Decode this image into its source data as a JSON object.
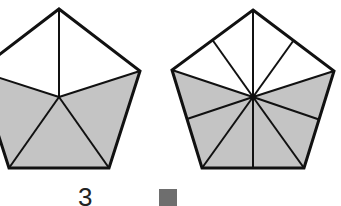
{
  "figure": {
    "shade_color": "#c4c4c4",
    "line_color": "#111111",
    "pentagons": [
      {
        "name": "pentagon-left",
        "parts": 5,
        "shaded_parts": 3,
        "center": [
          59,
          97
        ],
        "vertices": [
          [
            59,
            9
          ],
          [
            140,
            71
          ],
          [
            109,
            168
          ],
          [
            9,
            168
          ],
          [
            -22,
            71
          ]
        ]
      },
      {
        "name": "pentagon-right",
        "parts": 10,
        "shaded_parts": 6,
        "center": [
          253,
          97
        ],
        "vertices": [
          [
            253,
            10
          ],
          [
            334,
            71
          ],
          [
            304,
            168
          ],
          [
            202,
            168
          ],
          [
            172,
            70
          ]
        ]
      }
    ]
  },
  "bottom": {
    "label_text": "3",
    "swatch_color": "#6e6e6e"
  }
}
